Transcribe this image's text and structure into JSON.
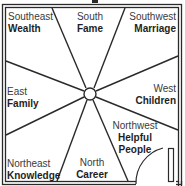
{
  "diagram": {
    "type": "bagua-floor-plan",
    "colors": {
      "line": "#2a2a2a",
      "background": "#ffffff",
      "text": "#2a2a2a"
    },
    "sectors": [
      {
        "id": "southeast",
        "direction": "Southeast",
        "area": "Wealth"
      },
      {
        "id": "south",
        "direction": "South",
        "area": "Fame"
      },
      {
        "id": "southwest",
        "direction": "Southwest",
        "area": "Marriage"
      },
      {
        "id": "east",
        "direction": "East",
        "area": "Family"
      },
      {
        "id": "west",
        "direction": "West",
        "area": "Children"
      },
      {
        "id": "northeast",
        "direction": "Northeast",
        "area": "Knowledge"
      },
      {
        "id": "north",
        "direction": "North",
        "area": "Career"
      },
      {
        "id": "northwest",
        "direction": "Northwest",
        "area_line1": "Helpful",
        "area_line2": "People"
      }
    ],
    "icons": {
      "center": "center-circle",
      "door": "door-icon"
    }
  }
}
